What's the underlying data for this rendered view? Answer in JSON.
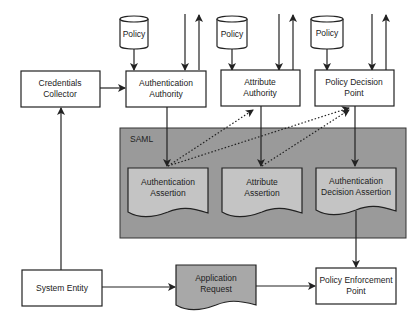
{
  "diagram": {
    "type": "flowchart",
    "colors": {
      "background": "#ffffff",
      "stroke": "#222222",
      "saml_fill": "#9a9a9a",
      "assertion_fill": "#c4c4c4",
      "request_fill": "#a8a8a8",
      "box_fill": "#ffffff"
    },
    "saml": {
      "label": "SAML"
    },
    "policy_stores": [
      {
        "id": "policy-1",
        "label": "Policy"
      },
      {
        "id": "policy-2",
        "label": "Policy"
      },
      {
        "id": "policy-3",
        "label": "Policy"
      }
    ],
    "boxes": {
      "credentials_collector": {
        "line1": "Credentials",
        "line2": "Collector"
      },
      "authentication_authority": {
        "line1": "Authentication",
        "line2": "Authority"
      },
      "attribute_authority": {
        "line1": "Attribute",
        "line2": "Authority"
      },
      "policy_decision_point": {
        "line1": "Policy Decision",
        "line2": "Point"
      },
      "system_entity": {
        "line1": "System Entity"
      },
      "policy_enforcement_point": {
        "line1": "Policy Enforcement",
        "line2": "Point"
      }
    },
    "documents": {
      "authentication_assertion": {
        "line1": "Authentication",
        "line2": "Assertion"
      },
      "attribute_assertion": {
        "line1": "Attribute",
        "line2": "Assertion"
      },
      "authentication_decision_assertion": {
        "line1": "Authentication",
        "line2": "Decision Assertion"
      },
      "application_request": {
        "line1": "Application",
        "line2": "Request"
      }
    },
    "edges": [
      {
        "from": "Policy",
        "to": "Authentication Authority",
        "style": "solid"
      },
      {
        "from": "Policy",
        "to": "Attribute Authority",
        "style": "solid"
      },
      {
        "from": "Policy",
        "to": "Policy Decision Point",
        "style": "solid"
      },
      {
        "from": "Credentials Collector",
        "to": "Authentication Authority",
        "style": "solid"
      },
      {
        "from": "System Entity",
        "to": "Credentials Collector",
        "style": "solid"
      },
      {
        "from": "Authentication Authority",
        "to": "Authentication Assertion",
        "style": "solid"
      },
      {
        "from": "Attribute Authority",
        "to": "Attribute Assertion",
        "style": "solid"
      },
      {
        "from": "Policy Decision Point",
        "to": "Authentication Decision Assertion",
        "style": "solid"
      },
      {
        "from": "Authentication Assertion",
        "to": "Attribute Authority",
        "style": "dotted"
      },
      {
        "from": "Authentication Assertion",
        "to": "Policy Decision Point",
        "style": "dotted"
      },
      {
        "from": "Attribute Assertion",
        "to": "Policy Decision Point",
        "style": "dotted"
      },
      {
        "from": "Authentication Decision Assertion",
        "to": "Policy Enforcement Point",
        "style": "solid"
      },
      {
        "from": "System Entity",
        "to": "Application Request",
        "style": "solid"
      },
      {
        "from": "Application Request",
        "to": "Policy Enforcement Point",
        "style": "solid"
      },
      {
        "from": "external",
        "to": "Authentication Authority",
        "style": "solid"
      },
      {
        "from": "Authentication Authority",
        "to": "external",
        "style": "solid"
      },
      {
        "from": "external",
        "to": "Attribute Authority",
        "style": "solid"
      },
      {
        "from": "Attribute Authority",
        "to": "external",
        "style": "solid"
      },
      {
        "from": "external",
        "to": "Policy Decision Point",
        "style": "solid"
      },
      {
        "from": "Policy Decision Point",
        "to": "external",
        "style": "solid"
      }
    ]
  }
}
